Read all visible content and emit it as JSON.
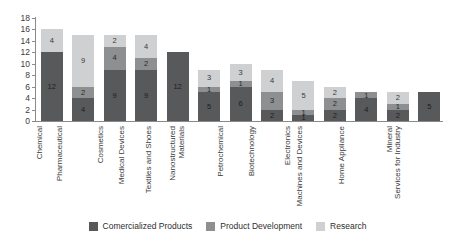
{
  "chart_data": {
    "type": "bar",
    "stacked": true,
    "title": "",
    "xlabel": "",
    "ylabel": "",
    "ylim": [
      0,
      18
    ],
    "yticks": [
      0,
      2,
      4,
      6,
      8,
      10,
      12,
      14,
      16,
      18
    ],
    "grid": false,
    "legend_position": "bottom",
    "categories": [
      "Chemical",
      "Pharmaceutical",
      "Cosmetics",
      "Medical Devices",
      "Textiles and Shoes",
      "Nanostructured Materials",
      "Petrochemical",
      "Biotechnology",
      "Electronics",
      "Machines and Devices",
      "Home Appliance",
      "Mineral",
      "Services for Industry"
    ],
    "series": [
      {
        "name": "Comercialized Products",
        "color": "#58595b",
        "values": [
          12,
          4,
          9,
          9,
          12,
          5,
          6,
          2,
          1,
          2,
          4,
          2,
          5
        ]
      },
      {
        "name": "Product Development",
        "color": "#8d8f91",
        "values": [
          0,
          2,
          4,
          2,
          0,
          1,
          1,
          3,
          1,
          2,
          1,
          1,
          0
        ]
      },
      {
        "name": "Research",
        "color": "#cfd0d1",
        "values": [
          4,
          9,
          2,
          4,
          0,
          3,
          3,
          4,
          5,
          2,
          0,
          2,
          0
        ]
      }
    ],
    "totals": [
      16,
      15,
      15,
      15,
      12,
      9,
      10,
      9,
      7,
      6,
      5,
      5,
      5
    ]
  },
  "legend": {
    "items": [
      {
        "label": "Comercialized Products"
      },
      {
        "label": "Product Development"
      },
      {
        "label": "Research"
      }
    ]
  }
}
